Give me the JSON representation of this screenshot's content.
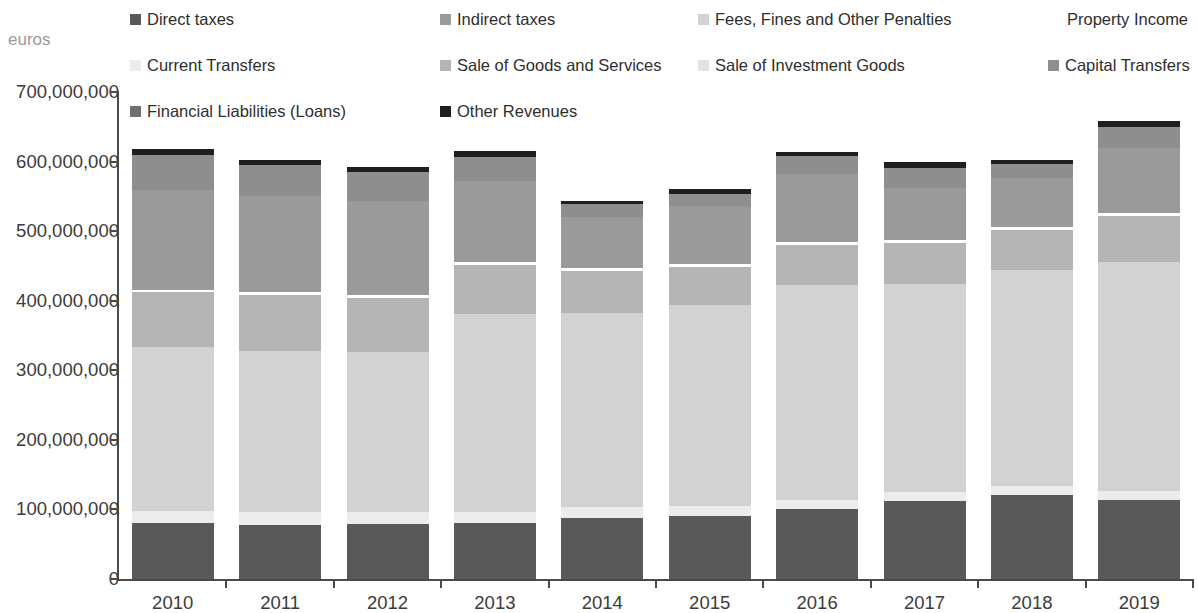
{
  "axis_label": "euros",
  "legend": {
    "rows": [
      [
        {
          "label": "Direct taxes",
          "color": "#595959",
          "x": 10
        },
        {
          "label": "Indirect taxes",
          "color": "#9a9a9a",
          "x": 320
        },
        {
          "label": "Fees, Fines and Other Penalties",
          "color": "#d2d2d2",
          "x": 578
        },
        {
          "label": "Property Income",
          "color": "#ffffff",
          "x": 928
        }
      ],
      [
        {
          "label": "Current Transfers",
          "color": "#ececec",
          "x": 10
        },
        {
          "label": "Sale of Goods and Services",
          "color": "#b4b4b4",
          "x": 320
        },
        {
          "label": "Sale of Investment Goods",
          "color": "#e2e2e2",
          "x": 578
        },
        {
          "label": "Capital Transfers",
          "color": "#8e8e8e",
          "x": 928
        }
      ],
      [
        {
          "label": "Financial Liabilities (Loans)",
          "color": "#707070",
          "x": 10
        },
        {
          "label": "Other Revenues",
          "color": "#1f1f1f",
          "x": 320
        }
      ]
    ]
  },
  "yaxis": {
    "ticks": [
      "700,000,000",
      "600,000,000",
      "500,000,000",
      "400,000,000",
      "300,000,000",
      "200,000,000",
      "100,000,000",
      "0"
    ],
    "values": [
      700000000,
      600000000,
      500000000,
      400000000,
      300000000,
      200000000,
      100000000,
      0
    ]
  },
  "chart_data": {
    "type": "bar",
    "subtype": "stacked-vertical",
    "title": "",
    "xlabel": "",
    "ylabel": "euros",
    "ylim": [
      0,
      700000000
    ],
    "ytick_step": 100000000,
    "grid": false,
    "legend_position": "top",
    "categories": [
      "2010",
      "2011",
      "2012",
      "2013",
      "2014",
      "2015",
      "2016",
      "2017",
      "2018",
      "2019"
    ],
    "series": [
      {
        "name": "Direct taxes",
        "color": "#595959",
        "values": [
          80000000,
          78000000,
          79000000,
          80000000,
          88000000,
          91000000,
          100000000,
          112000000,
          121000000,
          113000000
        ]
      },
      {
        "name": "Current Transfers",
        "color": "#ececec",
        "values": [
          18000000,
          19000000,
          18000000,
          17000000,
          15000000,
          14000000,
          14000000,
          13000000,
          13000000,
          14000000
        ]
      },
      {
        "name": "Financial Liabilities (Loans)",
        "color": "#707070",
        "values": [
          0,
          0,
          0,
          0,
          0,
          0,
          0,
          0,
          0,
          0
        ]
      },
      {
        "name": "Fees, Fines and Other Penalties",
        "color": "#d2d2d2",
        "values": [
          236000000,
          231000000,
          230000000,
          284000000,
          280000000,
          289000000,
          309000000,
          299000000,
          310000000,
          328000000
        ]
      },
      {
        "name": "Sale of Goods and Services",
        "color": "#b4b4b4",
        "values": [
          78000000,
          80000000,
          77000000,
          70000000,
          60000000,
          55000000,
          57000000,
          59000000,
          58000000,
          67000000
        ]
      },
      {
        "name": "Sale of Investment Goods",
        "color": "#ffffff",
        "values": [
          4000000,
          4000000,
          4000000,
          4000000,
          4000000,
          4000000,
          4000000,
          4000000,
          4000000,
          4000000
        ]
      },
      {
        "name": "Indirect taxes",
        "color": "#9a9a9a",
        "values": [
          143000000,
          138000000,
          135000000,
          117000000,
          74000000,
          83000000,
          98000000,
          75000000,
          70000000,
          93000000
        ]
      },
      {
        "name": "Property Income",
        "color": "#ffffff",
        "values": [
          0,
          0,
          0,
          0,
          0,
          0,
          0,
          0,
          0,
          0
        ]
      },
      {
        "name": "Capital Transfers",
        "color": "#8e8e8e",
        "values": [
          50000000,
          45000000,
          42000000,
          35000000,
          18000000,
          18000000,
          26000000,
          29000000,
          20000000,
          31000000
        ]
      },
      {
        "name": "Other Revenues",
        "color": "#1f1f1f",
        "values": [
          9000000,
          8000000,
          7000000,
          8000000,
          5000000,
          6000000,
          6000000,
          9000000,
          6000000,
          9000000
        ]
      }
    ],
    "totals": [
      618000000,
      603000000,
      592000000,
      615000000,
      544000000,
      560000000,
      614000000,
      600000000,
      602000000,
      659000000
    ]
  }
}
